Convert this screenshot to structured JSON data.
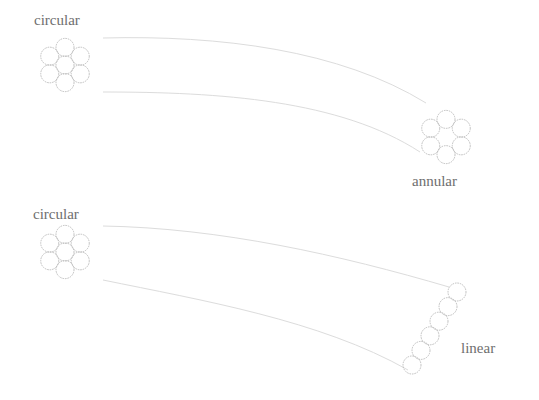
{
  "diagram": {
    "panels": [
      {
        "id": "top",
        "source": {
          "label": "circular",
          "label_pos": [
            34,
            25
          ],
          "center": [
            65,
            65
          ],
          "arrangement": "hexagonal-7"
        },
        "target": {
          "label": "annular",
          "label_pos": [
            412,
            186
          ],
          "center": [
            446,
            137
          ],
          "arrangement": "ring-6"
        },
        "curves": [
          {
            "d": "M 103 38 C 220 35, 340 50, 426 103"
          },
          {
            "d": "M 103 92 C 220 92, 340 100, 420 152"
          }
        ]
      },
      {
        "id": "bottom",
        "source": {
          "label": "circular",
          "label_pos": [
            33,
            219
          ],
          "center": [
            65,
            252
          ],
          "arrangement": "hexagonal-7"
        },
        "target": {
          "label": "linear",
          "label_pos": [
            461,
            353
          ],
          "start": [
            457,
            292
          ],
          "step": [
            -9,
            14.6
          ],
          "count": 6,
          "arrangement": "line-6"
        },
        "curves": [
          {
            "d": "M 103 226 C 220 228, 340 255, 449 287"
          },
          {
            "d": "M 103 280 C 200 300, 320 320, 408 370"
          }
        ]
      }
    ],
    "circle_radius": 9,
    "colors": {
      "circle_stroke": "#b8b8b8",
      "curve": "#dcdcdc",
      "label": "#6e6e6e"
    }
  }
}
